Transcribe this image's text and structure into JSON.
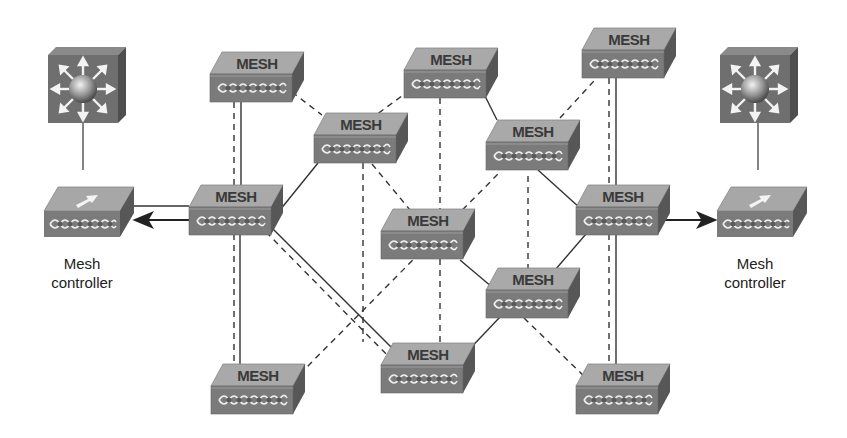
{
  "diagram": {
    "type": "wireless mesh network topology",
    "colors": {
      "background": "#ffffff",
      "device_top": "#a8a8a8",
      "device_front": "#7a7a7a",
      "device_side": "#555555",
      "router_face": "#6e6e6e",
      "line": "#333333"
    },
    "mesh_node_label": "MESH",
    "mesh_nodes": [
      {
        "id": "n1",
        "label": "MESH",
        "x": 210,
        "y": 52
      },
      {
        "id": "n2",
        "label": "MESH",
        "x": 314,
        "y": 112
      },
      {
        "id": "n3",
        "label": "MESH",
        "x": 404,
        "y": 48
      },
      {
        "id": "n4",
        "label": "MESH",
        "x": 486,
        "y": 120
      },
      {
        "id": "n5",
        "label": "MESH",
        "x": 582,
        "y": 28
      },
      {
        "id": "n6",
        "label": "MESH",
        "x": 189,
        "y": 184
      },
      {
        "id": "n7",
        "label": "MESH",
        "x": 381,
        "y": 208
      },
      {
        "id": "n8",
        "label": "MESH",
        "x": 576,
        "y": 184
      },
      {
        "id": "n9",
        "label": "MESH",
        "x": 486,
        "y": 266
      },
      {
        "id": "n10",
        "label": "MESH",
        "x": 211,
        "y": 364
      },
      {
        "id": "n11",
        "label": "MESH",
        "x": 381,
        "y": 342
      },
      {
        "id": "n12",
        "label": "MESH",
        "x": 576,
        "y": 364
      }
    ],
    "controllers": [
      {
        "id": "ctrl-left",
        "label_line1": "Mesh",
        "label_line2": "controller"
      },
      {
        "id": "ctrl-right",
        "label_line1": "Mesh",
        "label_line2": "controller"
      }
    ],
    "routers": [
      {
        "id": "router-left",
        "icon": "multilayer-switch-icon"
      },
      {
        "id": "router-right",
        "icon": "multilayer-switch-icon"
      }
    ],
    "links": {
      "solid": [
        [
          "n1",
          "n6"
        ],
        [
          "n6",
          "n2"
        ],
        [
          "n6",
          "n11"
        ],
        [
          "n3",
          "n4"
        ],
        [
          "n4",
          "n8"
        ],
        [
          "n8",
          "n9"
        ],
        [
          "n7",
          "n9"
        ],
        [
          "n9",
          "n11"
        ],
        [
          "n5",
          "n8"
        ],
        [
          "n6",
          "n10"
        ],
        [
          "n8",
          "n12"
        ]
      ],
      "dashed": [
        [
          "n1",
          "n6"
        ],
        [
          "n1",
          "n2"
        ],
        [
          "n2",
          "n7"
        ],
        [
          "n2",
          "n11"
        ],
        [
          "n3",
          "n2"
        ],
        [
          "n3",
          "n7"
        ],
        [
          "n4",
          "n5"
        ],
        [
          "n4",
          "n7"
        ],
        [
          "n4",
          "n9"
        ],
        [
          "n6",
          "n10"
        ],
        [
          "n6",
          "n11"
        ],
        [
          "n7",
          "n10"
        ],
        [
          "n9",
          "n12"
        ],
        [
          "n5",
          "n8"
        ],
        [
          "n8",
          "n12"
        ],
        [
          "n7",
          "n11"
        ]
      ],
      "arrows": [
        [
          "n6",
          "ctrl-left"
        ],
        [
          "n8",
          "ctrl-right"
        ]
      ]
    }
  }
}
